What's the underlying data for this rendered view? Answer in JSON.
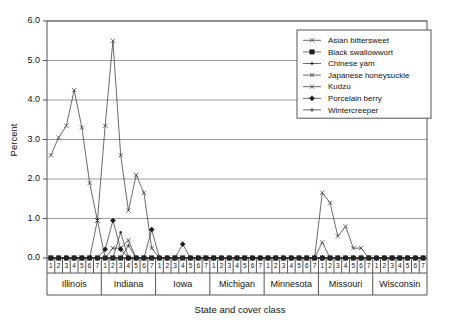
{
  "chart_data": {
    "type": "line",
    "title": "",
    "xlabel": "State and cover class",
    "ylabel": "Percent",
    "ylim": [
      0.0,
      6.0
    ],
    "ytick_labels": [
      "0.0",
      "1.0",
      "2.0",
      "3.0",
      "4.0",
      "5.0",
      "6.0"
    ],
    "ytick_values": [
      0.0,
      1.0,
      2.0,
      3.0,
      4.0,
      5.0,
      6.0
    ],
    "grid": "horizontal",
    "legend_position": "top-right inside",
    "states": [
      "Illinois",
      "Indiana",
      "Iowa",
      "Michigan",
      "Minnesota",
      "Missouri",
      "Wisconsin"
    ],
    "cover_classes": [
      "1",
      "2",
      "3",
      "4",
      "5",
      "6",
      "7"
    ],
    "categories": [
      "Illinois 1",
      "Illinois 2",
      "Illinois 3",
      "Illinois 4",
      "Illinois 5",
      "Illinois 6",
      "Illinois 7",
      "Indiana 1",
      "Indiana 2",
      "Indiana 3",
      "Indiana 4",
      "Indiana 5",
      "Indiana 6",
      "Indiana 7",
      "Iowa 1",
      "Iowa 2",
      "Iowa 3",
      "Iowa 4",
      "Iowa 5",
      "Iowa 6",
      "Iowa 7",
      "Michigan 1",
      "Michigan 2",
      "Michigan 3",
      "Michigan 4",
      "Michigan 5",
      "Michigan 6",
      "Michigan 7",
      "Minnesota 1",
      "Minnesota 2",
      "Minnesota 3",
      "Minnesota 4",
      "Minnesota 5",
      "Minnesota 6",
      "Minnesota 7",
      "Missouri 1",
      "Missouri 2",
      "Missouri 3",
      "Missouri 4",
      "Missouri 5",
      "Missouri 6",
      "Missouri 7",
      "Wisconsin 1",
      "Wisconsin 2",
      "Wisconsin 3",
      "Wisconsin 4",
      "Wisconsin 5",
      "Wisconsin 6",
      "Wisconsin 7"
    ],
    "series": [
      {
        "name": "Asian bittersweet",
        "marker": "x",
        "values": [
          2.6,
          3.05,
          3.35,
          4.25,
          3.3,
          1.9,
          0.95,
          3.35,
          5.5,
          2.6,
          1.2,
          2.1,
          1.65,
          0.25,
          0.0,
          0.0,
          0.0,
          0.0,
          0.0,
          0.0,
          0.0,
          0.0,
          0.0,
          0.0,
          0.0,
          0.0,
          0.0,
          0.0,
          0.0,
          0.0,
          0.0,
          0.0,
          0.0,
          0.0,
          0.0,
          1.65,
          1.4,
          0.55,
          0.8,
          0.25,
          0.25,
          0.0,
          0.0,
          0.0,
          0.0,
          0.0,
          0.0,
          0.0,
          0.0
        ]
      },
      {
        "name": "Black swallowwort",
        "marker": "filled-square",
        "values": [
          0.0,
          0.0,
          0.0,
          0.0,
          0.0,
          0.0,
          0.0,
          0.0,
          0.0,
          0.0,
          0.0,
          0.0,
          0.0,
          0.0,
          0.0,
          0.0,
          0.0,
          0.0,
          0.0,
          0.0,
          0.0,
          0.0,
          0.0,
          0.0,
          0.0,
          0.0,
          0.0,
          0.0,
          0.0,
          0.0,
          0.0,
          0.0,
          0.0,
          0.0,
          0.0,
          0.0,
          0.0,
          0.0,
          0.0,
          0.0,
          0.0,
          0.0,
          0.0,
          0.0,
          0.0,
          0.0,
          0.0,
          0.0,
          0.0
        ]
      },
      {
        "name": "Chinese yam",
        "marker": "dot",
        "values": [
          0.0,
          0.0,
          0.0,
          0.0,
          0.0,
          0.0,
          0.0,
          0.0,
          0.0,
          0.65,
          0.0,
          0.0,
          0.0,
          0.0,
          0.0,
          0.0,
          0.0,
          0.0,
          0.0,
          0.0,
          0.0,
          0.0,
          0.0,
          0.0,
          0.0,
          0.0,
          0.0,
          0.0,
          0.0,
          0.0,
          0.0,
          0.0,
          0.0,
          0.0,
          0.0,
          0.0,
          0.0,
          0.0,
          0.0,
          0.0,
          0.0,
          0.0,
          0.0,
          0.0,
          0.0,
          0.0,
          0.0,
          0.0,
          0.0
        ]
      },
      {
        "name": "Japanese honeysuckle",
        "marker": "x",
        "values": [
          0.0,
          0.0,
          0.0,
          0.0,
          0.0,
          0.0,
          0.95,
          0.0,
          0.25,
          0.25,
          0.45,
          0.0,
          0.0,
          0.0,
          0.0,
          0.0,
          0.0,
          0.0,
          0.0,
          0.0,
          0.0,
          0.0,
          0.0,
          0.0,
          0.0,
          0.0,
          0.0,
          0.0,
          0.0,
          0.0,
          0.0,
          0.0,
          0.0,
          0.0,
          0.0,
          0.4,
          0.0,
          0.0,
          0.0,
          0.0,
          0.0,
          0.0,
          0.0,
          0.0,
          0.0,
          0.0,
          0.0,
          0.0,
          0.0
        ]
      },
      {
        "name": "Kudzu",
        "marker": "x",
        "values": [
          0.0,
          0.0,
          0.0,
          0.0,
          0.0,
          0.0,
          0.0,
          0.0,
          0.0,
          0.0,
          0.0,
          0.0,
          0.0,
          0.0,
          0.0,
          0.0,
          0.0,
          0.0,
          0.0,
          0.0,
          0.0,
          0.0,
          0.0,
          0.0,
          0.0,
          0.0,
          0.0,
          0.0,
          0.0,
          0.0,
          0.0,
          0.0,
          0.0,
          0.0,
          0.0,
          0.0,
          0.0,
          0.0,
          0.0,
          0.0,
          0.0,
          0.0,
          0.0,
          0.0,
          0.0,
          0.0,
          0.0,
          0.0,
          0.0
        ]
      },
      {
        "name": "Porcelain berry",
        "marker": "filled-diamond",
        "values": [
          0.0,
          0.0,
          0.0,
          0.0,
          0.0,
          0.0,
          0.0,
          0.22,
          0.95,
          0.22,
          0.0,
          0.0,
          0.0,
          0.72,
          0.0,
          0.0,
          0.0,
          0.35,
          0.0,
          0.0,
          0.0,
          0.0,
          0.0,
          0.0,
          0.0,
          0.0,
          0.0,
          0.0,
          0.0,
          0.0,
          0.0,
          0.0,
          0.0,
          0.0,
          0.0,
          0.0,
          0.0,
          0.0,
          0.0,
          0.0,
          0.0,
          0.0,
          0.0,
          0.0,
          0.0,
          0.0,
          0.0,
          0.0,
          0.0
        ]
      },
      {
        "name": "Wintercreeper",
        "marker": "plus",
        "values": [
          0.0,
          0.0,
          0.0,
          0.0,
          0.0,
          0.0,
          0.0,
          0.0,
          0.0,
          0.0,
          0.32,
          0.0,
          0.0,
          0.0,
          0.0,
          0.0,
          0.0,
          0.0,
          0.0,
          0.0,
          0.0,
          0.0,
          0.0,
          0.0,
          0.0,
          0.0,
          0.0,
          0.0,
          0.0,
          0.0,
          0.0,
          0.0,
          0.0,
          0.0,
          0.0,
          0.0,
          0.0,
          0.0,
          0.0,
          0.0,
          0.0,
          0.0,
          0.0,
          0.0,
          0.0,
          0.0,
          0.0,
          0.0,
          0.0
        ]
      }
    ]
  },
  "legend": {
    "entries": [
      {
        "label": "Asian bittersweet",
        "marker": "x"
      },
      {
        "label": "Black swallowwort",
        "marker": "filled-square"
      },
      {
        "label": "Chinese yam",
        "marker": "dot"
      },
      {
        "label": "Japanese honeysuckle",
        "marker": "x"
      },
      {
        "label": "Kudzu",
        "marker": "x"
      },
      {
        "label": "Porcelain berry",
        "marker": "filled-diamond"
      },
      {
        "label": "Wintercreeper",
        "marker": "plus"
      }
    ]
  },
  "colors": {
    "line": "#2b2b2b",
    "grid": "#9a9a9a",
    "axis": "#555555",
    "text": "#111111",
    "background": "#ffffff"
  }
}
